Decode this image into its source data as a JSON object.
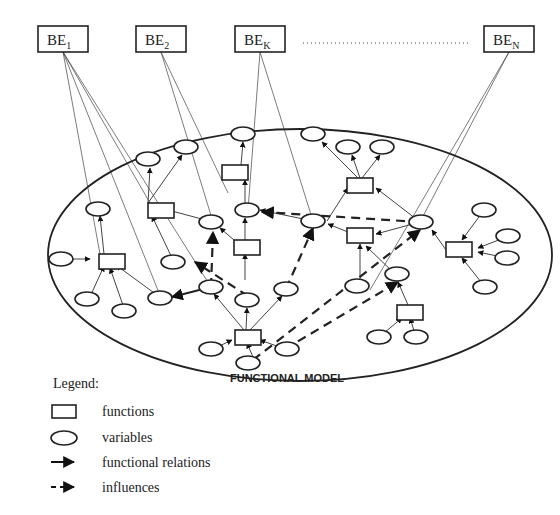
{
  "behavioural_elements": [
    {
      "id": "BE1",
      "label": "BE",
      "sub": "1",
      "x": 38,
      "y": 26,
      "w": 50,
      "h": 26
    },
    {
      "id": "BE2",
      "label": "BE",
      "sub": "2",
      "x": 136,
      "y": 26,
      "w": 50,
      "h": 26
    },
    {
      "id": "BEK",
      "label": "BE",
      "sub": "K",
      "x": 235,
      "y": 26,
      "w": 50,
      "h": 26
    },
    {
      "id": "BEN",
      "label": "BE",
      "sub": "N",
      "x": 484,
      "y": 26,
      "w": 50,
      "h": 26
    }
  ],
  "ellipsis_dots": {
    "x1": 303,
    "x2": 470,
    "y": 43
  },
  "model": {
    "label": "FUNCTIONAL MODEL",
    "cx": 300,
    "cy": 255,
    "rx": 250,
    "ry": 125
  },
  "functions": [
    {
      "x": 235,
      "y": 165
    },
    {
      "x": 148,
      "y": 203
    },
    {
      "x": 348,
      "y": 178
    },
    {
      "x": 99,
      "y": 254
    },
    {
      "x": 234,
      "y": 240
    },
    {
      "x": 348,
      "y": 228
    },
    {
      "x": 446,
      "y": 242
    },
    {
      "x": 397,
      "y": 305
    },
    {
      "x": 235,
      "y": 330
    }
  ],
  "variables": [
    {
      "x": 243,
      "y": 135
    },
    {
      "x": 313,
      "y": 135
    },
    {
      "x": 150,
      "y": 159
    },
    {
      "x": 185,
      "y": 147
    },
    {
      "x": 348,
      "y": 147
    },
    {
      "x": 382,
      "y": 147
    },
    {
      "x": 100,
      "y": 209
    },
    {
      "x": 213,
      "y": 222
    },
    {
      "x": 248,
      "y": 210
    },
    {
      "x": 313,
      "y": 221
    },
    {
      "x": 420,
      "y": 222
    },
    {
      "x": 484,
      "y": 210
    },
    {
      "x": 509,
      "y": 236
    },
    {
      "x": 507,
      "y": 258
    },
    {
      "x": 485,
      "y": 287
    },
    {
      "x": 62,
      "y": 259
    },
    {
      "x": 174,
      "y": 262
    },
    {
      "x": 89,
      "y": 299
    },
    {
      "x": 125,
      "y": 311
    },
    {
      "x": 161,
      "y": 298
    },
    {
      "x": 211,
      "y": 287
    },
    {
      "x": 247,
      "y": 300
    },
    {
      "x": 286,
      "y": 289
    },
    {
      "x": 357,
      "y": 286
    },
    {
      "x": 396,
      "y": 275
    },
    {
      "x": 213,
      "y": 349
    },
    {
      "x": 285,
      "y": 349
    },
    {
      "x": 253,
      "y": 364
    },
    {
      "x": 379,
      "y": 337
    },
    {
      "x": 416,
      "y": 337
    }
  ],
  "legend": {
    "title": "Legend:",
    "items": [
      {
        "symbol": "rectangle",
        "label": "functions"
      },
      {
        "symbol": "ellipse",
        "label": "variables"
      },
      {
        "symbol": "solid-arrow",
        "label": "functional relations"
      },
      {
        "symbol": "dashed-arrow",
        "label": "influences"
      }
    ]
  }
}
